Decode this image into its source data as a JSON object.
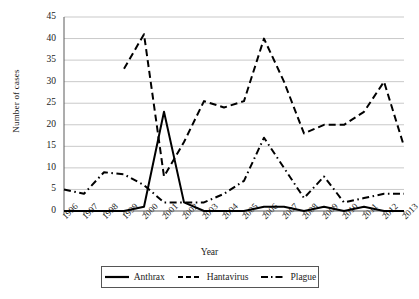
{
  "chart_data": {
    "type": "line",
    "title": "",
    "xlabel": "Year",
    "ylabel": "Number of cases",
    "categories": [
      1996,
      1997,
      1998,
      1999,
      2000,
      2001,
      2002,
      2003,
      2004,
      2005,
      2006,
      2007,
      2008,
      2009,
      2010,
      2011,
      2012,
      2013
    ],
    "ylim": [
      0,
      45
    ],
    "ytick_step": 5,
    "yticks": [
      0,
      5,
      10,
      15,
      20,
      25,
      30,
      35,
      40,
      45
    ],
    "grid": "horizontal",
    "legend_position": "bottom",
    "series": [
      {
        "name": "Anthrax",
        "style": "solid",
        "color": "#000000",
        "values": [
          0,
          0,
          0,
          0,
          1,
          23,
          2,
          0,
          0,
          0,
          1,
          1,
          0,
          1,
          0,
          1,
          0,
          0
        ]
      },
      {
        "name": "Hantavirus",
        "style": "dashed",
        "color": "#000000",
        "values": [
          null,
          null,
          null,
          33,
          41,
          8,
          16,
          25.5,
          24,
          25.5,
          40,
          30,
          18,
          20,
          20,
          23,
          30,
          15
        ]
      },
      {
        "name": "Plague",
        "style": "dashdot",
        "color": "#000000",
        "values": [
          5,
          4,
          9,
          8.5,
          6,
          2,
          2,
          2,
          4,
          7,
          17,
          10,
          3,
          8,
          2,
          3,
          4,
          4
        ]
      }
    ]
  },
  "axis": {
    "ytick_labels": [
      "45",
      "40",
      "35",
      "30",
      "25",
      "20",
      "15",
      "10",
      "5",
      "0"
    ],
    "xtick_labels": [
      "1996",
      "1997",
      "1998",
      "1999",
      "2000",
      "2001",
      "2002",
      "2003",
      "2004",
      "2005",
      "2006",
      "2007",
      "2008",
      "2009",
      "2010",
      "2011",
      "2012",
      "2013"
    ],
    "x_title": "Year",
    "y_title": "Number of cases"
  },
  "legend": {
    "items": [
      {
        "label": "Anthrax",
        "style": "solid"
      },
      {
        "label": "Hantavirus",
        "style": "dashed"
      },
      {
        "label": "Plague",
        "style": "dashdot"
      }
    ]
  }
}
